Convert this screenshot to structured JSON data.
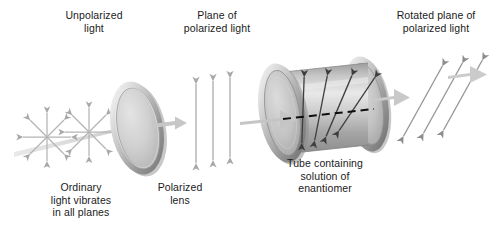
{
  "figure": {
    "background_color": "#ffffff",
    "text_color": "#1a1a1a",
    "width": 494,
    "height": 231
  },
  "labels": {
    "unpolarized": "Unpolarized\nlight",
    "plane_of_polarized": "Plane of\npolarized light",
    "rotated_plane": "Rotated plane of\npolarized light",
    "ordinary_light": "Ordinary\nlight vibrates\nin all planes",
    "polarized_lens": "Polarized\nlens",
    "tube": "Tube containing\nsolution of\nenantiomer"
  },
  "colors": {
    "beam_arrow": "#c9c9c9",
    "beam_arrow_edge": "#b0b0b0",
    "light_vector_pale": "#b6b6b6",
    "light_vector_dark": "#4a4a4a",
    "lens_face": "#d2d2d2",
    "lens_rim_light": "#f2f2f2",
    "lens_rim_dark": "#8e8e8e",
    "tube_body": "#c0c0c0",
    "tube_highlight": "#e8e8e8",
    "tube_shadow": "#8a8a8a",
    "dashed_axis": "#111111"
  },
  "elements": {
    "starbursts": {
      "name": "unpolarized-light-starburst",
      "count": 2,
      "rays_per_burst": 8,
      "centers": [
        [
          47,
          137
        ],
        [
          88,
          133
        ]
      ],
      "radius": 25,
      "description": "Double-headed arrows radiating in all directions representing ordinary light vibrating in all planes"
    },
    "polarized_lens": {
      "name": "polarized-lens-disc",
      "center": [
        137,
        128
      ],
      "rx": 26,
      "ry": 47,
      "tilt_deg": -12
    },
    "plane_polarized_arrows": {
      "name": "vertical-polarization-arrows",
      "count": 3,
      "x_positions": [
        196,
        213,
        230
      ],
      "top_y": 82,
      "bottom_y": 164,
      "angle_from_vertical_deg": 0
    },
    "tube": {
      "name": "enantiomer-solution-tube",
      "left_disc_center": [
        282,
        113
      ],
      "right_disc_center": [
        366,
        104
      ],
      "body_length": 84,
      "rx": 22,
      "ry": 48,
      "dashed_axis": true
    },
    "tube_internal_arrows": {
      "name": "rotating-polarization-arrows",
      "count": 4,
      "angles_from_vertical_deg": [
        0,
        10,
        22,
        34
      ],
      "x_positions": [
        303,
        320,
        337,
        354
      ]
    },
    "rotated_arrows": {
      "name": "rotated-polarization-arrows",
      "count": 3,
      "angle_from_vertical_deg": 30,
      "x_positions": [
        415,
        434,
        453
      ],
      "top_y": 62,
      "bottom_y": 140
    },
    "beam_arrows": {
      "name": "light-beam-arrows",
      "segments": [
        {
          "from": [
            18,
            147
          ],
          "to": [
            150,
            119
          ],
          "style": "pale-tapered"
        },
        {
          "from": [
            152,
            122
          ],
          "to": [
            188,
            117
          ],
          "style": "block"
        },
        {
          "from": [
            244,
            120
          ],
          "to": [
            296,
            116
          ],
          "style": "block"
        },
        {
          "from": [
            374,
            97
          ],
          "to": [
            408,
            92
          ],
          "style": "block"
        },
        {
          "from": [
            460,
            82
          ],
          "to": [
            488,
            78
          ],
          "style": "block"
        }
      ]
    }
  }
}
